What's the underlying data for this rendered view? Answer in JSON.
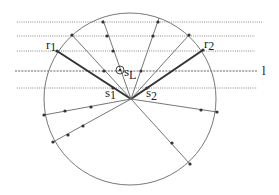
{
  "diagram": {
    "type": "geometric construction",
    "circle": {
      "cx": 130,
      "cy": 99,
      "r": 86,
      "stroke": "#777777"
    },
    "center": {
      "x": 131,
      "y": 99
    },
    "horizontal_lines": [
      {
        "y": 22,
        "x1": 17,
        "x2": 263,
        "style": "dotted"
      },
      {
        "y": 36,
        "x1": 17,
        "x2": 255,
        "style": "dotted"
      },
      {
        "y": 51,
        "x1": 17,
        "x2": 255,
        "style": "dotted"
      },
      {
        "y": 71,
        "x1": 15,
        "x2": 257,
        "style": "dashed",
        "label": "l"
      },
      {
        "y": 88,
        "x1": 17,
        "x2": 257,
        "style": "dotted"
      }
    ],
    "rays": [
      {
        "name": "ray-r1",
        "to": [
          57,
          51
        ],
        "thick": true,
        "dots": [
          [
            57,
            51
          ],
          [
            113,
            88
          ]
        ]
      },
      {
        "name": "ray-r2",
        "to": [
          203,
          50
        ],
        "thick": true,
        "dots": [
          [
            203,
            50
          ],
          [
            147,
            88
          ]
        ]
      },
      {
        "name": "ray-upper-left",
        "to": [
          72,
          35
        ],
        "thick": false,
        "dots": [
          [
            72,
            35
          ],
          [
            104,
            71
          ]
        ]
      },
      {
        "name": "ray-top-left",
        "to": [
          103,
          20
        ],
        "thick": false,
        "dots": [
          [
            103,
            22
          ],
          [
            107,
            36
          ],
          [
            113,
            51
          ]
        ]
      },
      {
        "name": "ray-top-right",
        "to": [
          159,
          18
        ],
        "thick": false,
        "dots": [
          [
            158,
            22
          ],
          [
            153,
            36
          ],
          [
            141,
            71
          ]
        ]
      },
      {
        "name": "ray-upper-right",
        "to": [
          189,
          35
        ],
        "thick": false,
        "dots": [
          [
            189,
            35
          ]
        ]
      },
      {
        "name": "ray-left",
        "to": [
          44,
          115
        ],
        "thick": false,
        "dots": [
          [
            44,
            115
          ],
          [
            65,
            111
          ],
          [
            91,
            107
          ]
        ]
      },
      {
        "name": "ray-lower-left",
        "to": [
          53,
          142
        ],
        "thick": false,
        "dots": [
          [
            53,
            142
          ],
          [
            68,
            135
          ],
          [
            83,
            126
          ]
        ]
      },
      {
        "name": "ray-right",
        "to": [
          217,
          112
        ],
        "thick": false,
        "dots": [
          [
            217,
            112
          ],
          [
            201,
            110
          ]
        ]
      },
      {
        "name": "ray-lower-right",
        "to": [
          190,
          164
        ],
        "thick": false,
        "dots": [
          [
            190,
            164
          ],
          [
            172,
            143
          ]
        ]
      }
    ],
    "marker_sL": {
      "x": 120,
      "y": 70,
      "r": 4
    }
  },
  "labels": {
    "r1": {
      "main": "r",
      "sub": "1"
    },
    "r2": {
      "main": "r",
      "sub": "2"
    },
    "s1": {
      "main": "s",
      "sub": "1"
    },
    "s2": {
      "main": "s",
      "sub": "2"
    },
    "sL": {
      "main": "s",
      "sub": "L"
    },
    "l": "l"
  }
}
